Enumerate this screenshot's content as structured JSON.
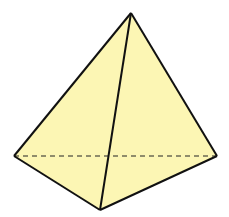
{
  "diagram": {
    "type": "tetrahedron",
    "fill_color": "#fcf6b4",
    "stroke_color": "#111111",
    "vertices": {
      "apex": [
        131,
        13
      ],
      "left": [
        14,
        156
      ],
      "right": [
        217,
        156
      ],
      "front": [
        100,
        210
      ]
    },
    "hidden_edge": "left-right"
  }
}
